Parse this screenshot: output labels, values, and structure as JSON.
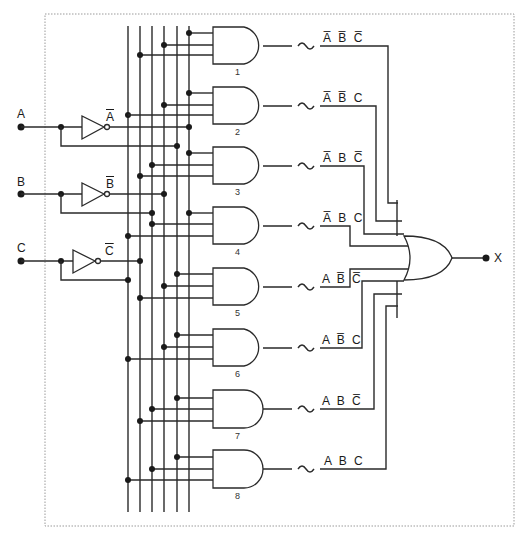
{
  "inputs": [
    {
      "name": "A",
      "inverted_label": "A"
    },
    {
      "name": "B",
      "inverted_label": "B"
    },
    {
      "name": "C",
      "inverted_label": "C"
    }
  ],
  "output": {
    "name": "X"
  },
  "and_gates": [
    {
      "number": "1",
      "term": "A̅ B̅ C̅"
    },
    {
      "number": "2",
      "term": "A̅ B̅ C"
    },
    {
      "number": "3",
      "term": "A̅ B C̅"
    },
    {
      "number": "4",
      "term": "A̅ B C"
    },
    {
      "number": "5",
      "term": "A B̅ C̅"
    },
    {
      "number": "6",
      "term": "A B̅ C"
    },
    {
      "number": "7",
      "term": "A B C̅"
    },
    {
      "number": "8",
      "term": "A B C"
    }
  ],
  "colors": {
    "line": "#2a2a2a",
    "frame": "#9a9a9a"
  }
}
